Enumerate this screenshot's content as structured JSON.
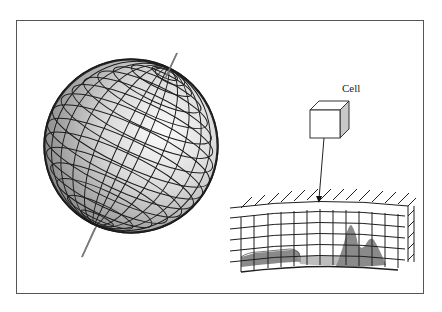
{
  "diagram": {
    "type": "globe-grid-cell-illustration",
    "labels": {
      "cell": "Cell"
    },
    "components": [
      {
        "id": "globe",
        "label": "Gridded globe with tilted rotation axis"
      },
      {
        "id": "cell-cube",
        "label": "Cell"
      },
      {
        "id": "pointer-arrow",
        "label": "Cell location on grid"
      },
      {
        "id": "grid-section",
        "label": "3D atmospheric grid over terrain"
      }
    ],
    "colors": {
      "frame": "#555555",
      "grid_lines": "#222222",
      "axis": "#777777",
      "terrain": "#8a8a8a",
      "water": "#bdbdbd",
      "cube_side": "#c8c8c8",
      "globe_light": "#f6f6f6",
      "globe_dark": "#8c8c8c"
    }
  }
}
